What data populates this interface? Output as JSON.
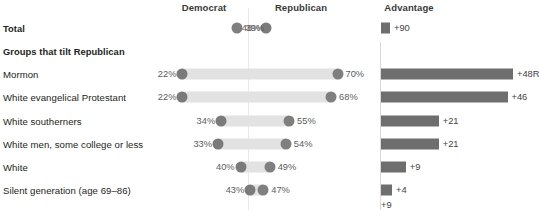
{
  "header": {
    "democrat": "Democrat",
    "republican": "Republican",
    "advantage": "Advantage"
  },
  "rows": [
    {
      "label": "Total",
      "bold": true,
      "dem": "48%",
      "rep": "39%",
      "adv": "+90"
    },
    {
      "label": "Groups that tilt Republican",
      "bold": true,
      "dem": "",
      "rep": "",
      "adv": ""
    },
    {
      "label": "Mormon",
      "bold": false,
      "dem": "22%",
      "rep": "70%",
      "adv": "+48R"
    },
    {
      "label": "White evangelical Protestant",
      "bold": false,
      "dem": "22%",
      "rep": "68%",
      "adv": "+46"
    },
    {
      "label": "White southerners",
      "bold": false,
      "dem": "34%",
      "rep": "55%",
      "adv": "+21"
    },
    {
      "label": "White men, some college or less",
      "bold": false,
      "dem": "33%",
      "rep": "54%",
      "adv": "+21"
    },
    {
      "label": "White",
      "bold": false,
      "dem": "40%",
      "rep": "49%",
      "adv": "+9"
    },
    {
      "label": "Silent generation (age 69–86)",
      "bold": false,
      "dem": "43%",
      "rep": "47%",
      "adv": "+4"
    }
  ],
  "fragment": {
    "label": "+9"
  },
  "chart_data": {
    "type": "bar",
    "title": "",
    "xlabel": "",
    "ylabel": "",
    "categories": [
      "Total",
      "Mormon",
      "White evangelical Protestant",
      "White southerners",
      "White men, some college or less",
      "White",
      "Silent generation (age 69–86)"
    ],
    "series": [
      {
        "name": "Democrat",
        "values": [
          48,
          22,
          22,
          34,
          33,
          40,
          43
        ]
      },
      {
        "name": "Republican",
        "values": [
          39,
          70,
          68,
          55,
          54,
          49,
          47
        ]
      },
      {
        "name": "Advantage",
        "values": [
          90,
          48,
          46,
          21,
          21,
          9,
          4
        ]
      }
    ],
    "advantage_labels": [
      "+90",
      "+48R",
      "+46",
      "+21",
      "+21",
      "+9",
      "+4"
    ],
    "grid": false,
    "legend": "top"
  },
  "colors": {
    "democrat_dot": "#7a7a7a",
    "republican_dot": "#7f7f7f",
    "track": "#e2e2e2",
    "advantage_bar": "#6e6e6e",
    "text": "#231f20"
  }
}
